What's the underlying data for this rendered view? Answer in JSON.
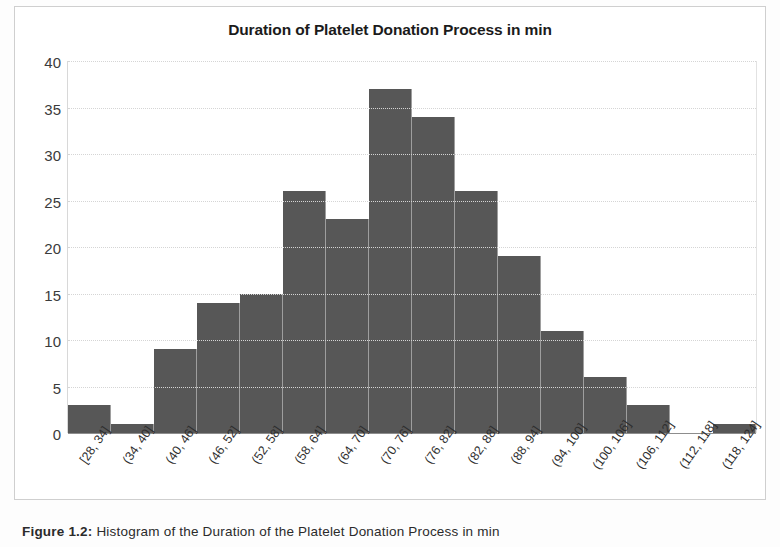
{
  "figure": {
    "caption_label": "Figure 1.2:",
    "caption_text": "Histogram of the Duration of the Platelet Donation Process in min"
  },
  "chart_data": {
    "type": "bar",
    "title": "Duration of Platelet Donation Process in min",
    "xlabel": "",
    "ylabel": "",
    "ylim": [
      0,
      40
    ],
    "yticks": [
      0,
      5,
      10,
      15,
      20,
      25,
      30,
      35,
      40
    ],
    "grid": true,
    "legend": null,
    "bar_color": "#575757",
    "categories": [
      "[28, 34]",
      "(34, 40]",
      "(40, 46]",
      "(46, 52]",
      "(52, 58]",
      "(58, 64]",
      "(64, 70]",
      "(70, 76]",
      "(76, 82]",
      "(82, 88]",
      "(88, 94]",
      "(94, 100]",
      "(100, 106]",
      "(106, 112]",
      "(112, 118]",
      "(118, 124]"
    ],
    "values": [
      3,
      1,
      9,
      14,
      15,
      26,
      23,
      37,
      34,
      26,
      19,
      11,
      6,
      3,
      0,
      1
    ]
  }
}
